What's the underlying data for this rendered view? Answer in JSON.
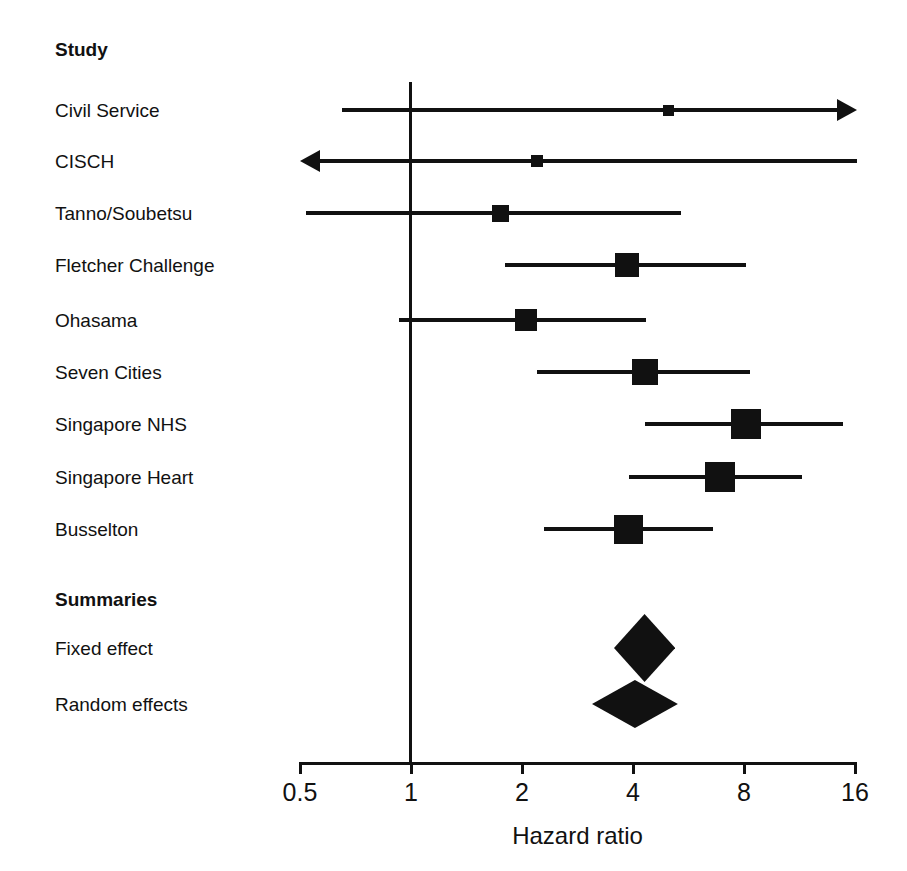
{
  "chart_data": {
    "type": "forest",
    "title": "",
    "xlabel": "Hazard ratio",
    "ylabel": "",
    "scale": "log2",
    "xlim": [
      0.5,
      16
    ],
    "grid": false,
    "reference_line": 1,
    "column_header": "Study",
    "summary_header": "Summaries",
    "tick_labels": [
      "0.5",
      "1",
      "2",
      "4",
      "8",
      "16"
    ],
    "tick_values": [
      0.5,
      1,
      2,
      4,
      8,
      16
    ],
    "studies": [
      {
        "label": "Civil Service",
        "estimate": 5.0,
        "ci_low": 0.65,
        "ci_high": 20.0,
        "marker_size": 11,
        "arrow_left": false,
        "arrow_right": true
      },
      {
        "label": "CISCH",
        "estimate": 2.2,
        "ci_low": 0.42,
        "ci_high": 21.0,
        "marker_size": 12,
        "arrow_left": true,
        "arrow_right": false
      },
      {
        "label": "Tanno/Soubetsu",
        "estimate": 1.75,
        "ci_low": 0.52,
        "ci_high": 5.4,
        "marker_size": 17,
        "arrow_left": false,
        "arrow_right": false
      },
      {
        "label": "Fletcher Challenge",
        "estimate": 3.85,
        "ci_low": 1.8,
        "ci_high": 8.1,
        "marker_size": 24,
        "arrow_left": false,
        "arrow_right": false
      },
      {
        "label": "Ohasama",
        "estimate": 2.05,
        "ci_low": 0.93,
        "ci_high": 4.35,
        "marker_size": 22,
        "arrow_left": false,
        "arrow_right": false
      },
      {
        "label": "Seven Cities",
        "estimate": 4.3,
        "ci_low": 2.2,
        "ci_high": 8.3,
        "marker_size": 26,
        "arrow_left": false,
        "arrow_right": false
      },
      {
        "label": "Singapore NHS",
        "estimate": 8.1,
        "ci_low": 4.3,
        "ci_high": 14.8,
        "marker_size": 30,
        "arrow_left": false,
        "arrow_right": false
      },
      {
        "label": "Singapore Heart",
        "estimate": 6.9,
        "ci_low": 3.9,
        "ci_high": 11.5,
        "marker_size": 30,
        "arrow_left": false,
        "arrow_right": false
      },
      {
        "label": "Busselton",
        "estimate": 3.9,
        "ci_low": 2.3,
        "ci_high": 6.6,
        "marker_size": 29,
        "arrow_left": false,
        "arrow_right": false
      }
    ],
    "summaries": [
      {
        "label": "Fixed effect",
        "estimate": 4.3,
        "ci_low": 3.55,
        "ci_high": 5.2,
        "half_height": 34
      },
      {
        "label": "Random effects",
        "estimate": 4.05,
        "ci_low": 3.1,
        "ci_high": 5.3,
        "half_height": 24
      }
    ]
  },
  "layout": {
    "axis": {
      "x_left_px": 300,
      "x_right_px": 855,
      "y_px": 762,
      "tick_height_px": 12,
      "ref_line_x_px": 410,
      "ref_line_top_px": 82,
      "ref_line_bottom_px": 762,
      "px_per_log2": 111.0,
      "origin_value": 0.5
    },
    "label_x_px": 55,
    "rows": [
      {
        "y": 110
      },
      {
        "y": 161
      },
      {
        "y": 213
      },
      {
        "y": 265
      },
      {
        "y": 320
      },
      {
        "y": 372
      },
      {
        "y": 424
      },
      {
        "y": 477
      },
      {
        "y": 529
      }
    ],
    "header_y_px": 40,
    "summary_header_y_px": 590,
    "summary_rows": [
      {
        "y": 648
      },
      {
        "y": 704
      }
    ]
  }
}
